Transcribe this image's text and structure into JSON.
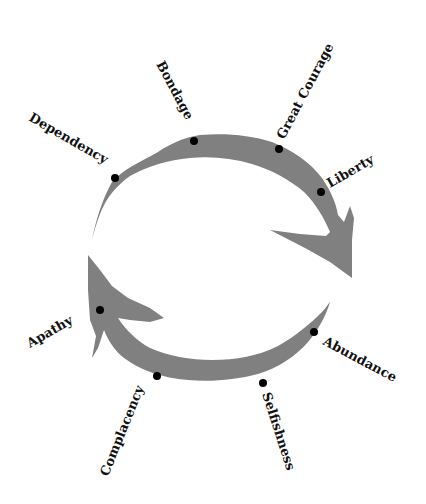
{
  "diagram": {
    "title": "",
    "arrow_color": "#808080",
    "dot_color": "#000000",
    "stages": [
      {
        "id": "bondage",
        "label": "Bondage"
      },
      {
        "id": "great-courage",
        "label": "Great Courage"
      },
      {
        "id": "liberty",
        "label": "Liberty"
      },
      {
        "id": "abundance",
        "label": "Abundance"
      },
      {
        "id": "selfishness",
        "label": "Selfishness"
      },
      {
        "id": "complacency",
        "label": "Complacency"
      },
      {
        "id": "apathy",
        "label": "Apathy"
      },
      {
        "id": "dependency",
        "label": "Dependency"
      }
    ]
  }
}
